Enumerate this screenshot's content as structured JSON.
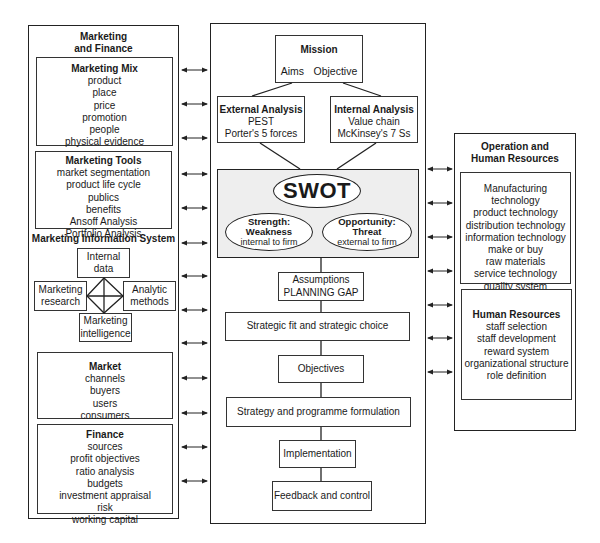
{
  "left_panel": {
    "title_line1": "Marketing",
    "title_line2": "and Finance",
    "marketing_mix": {
      "title": "Marketing Mix",
      "items": [
        "product",
        "place",
        "price",
        "promotion",
        "people",
        "physical evidence",
        "process"
      ]
    },
    "marketing_tools": {
      "title": "Marketing Tools",
      "items": [
        "market segmentation",
        "product life cycle",
        "publics",
        "benefits",
        "Ansoff Analysis",
        "Portfolio Analysis"
      ]
    },
    "mis": {
      "title": "Marketing Information System",
      "internal_data_1": "Internal",
      "internal_data_2": "data",
      "research_1": "Marketing",
      "research_2": "research",
      "analytic_1": "Analytic",
      "analytic_2": "methods",
      "intelligence_1": "Marketing",
      "intelligence_2": "intelligence"
    },
    "market": {
      "title": "Market",
      "items": [
        "channels",
        "buyers",
        "users",
        "consumers"
      ]
    },
    "finance": {
      "title": "Finance",
      "items": [
        "sources",
        "profit objectives",
        "ratio analysis",
        "budgets",
        "investment appraisal",
        "risk",
        "working capital"
      ]
    }
  },
  "center_panel": {
    "mission": {
      "title": "Mission",
      "aims": "Aims",
      "objective": "Objective"
    },
    "external_analysis": {
      "title": "External Analysis",
      "items": [
        "PEST",
        "Porter's 5 forces"
      ]
    },
    "internal_analysis": {
      "title": "Internal Analysis",
      "items": [
        "Value chain",
        "McKinsey's 7 Ss"
      ]
    },
    "swot": {
      "title": "SWOT",
      "strength": {
        "line1": "Strength:",
        "line2": "Weakness",
        "line3": "internal to firm"
      },
      "opportunity": {
        "line1": "Opportunity:",
        "line2": "Threat",
        "line3": "external to firm"
      }
    },
    "steps": {
      "assumptions_1": "Assumptions",
      "assumptions_2": "PLANNING GAP",
      "strategic_fit": "Strategic fit and strategic choice",
      "objectives": "Objectives",
      "strategy": "Strategy and programme formulation",
      "implementation": "Implementation",
      "feedback": "Feedback and control"
    }
  },
  "right_panel": {
    "title_line1": "Operation and",
    "title_line2": "Human Resources",
    "operations": {
      "items": [
        "Manufacturing technology",
        "product technology",
        "distribution technology",
        "information technology",
        "make or buy",
        "raw materials",
        "service technology",
        "quality system"
      ]
    },
    "human_resources": {
      "title": "Human Resources",
      "items": [
        "staff selection",
        "staff development",
        "reward system",
        "organizational structure",
        "role definition"
      ]
    }
  },
  "arrows": {
    "left_y": [
      70,
      104,
      138,
      174,
      208,
      243,
      276,
      310,
      343,
      378,
      413,
      447,
      481
    ],
    "right_y": [
      169,
      203,
      237,
      271,
      305,
      338,
      372
    ]
  },
  "colors": {
    "line": "#222222",
    "swot_fill": "#eeeeee",
    "background": "#ffffff"
  }
}
